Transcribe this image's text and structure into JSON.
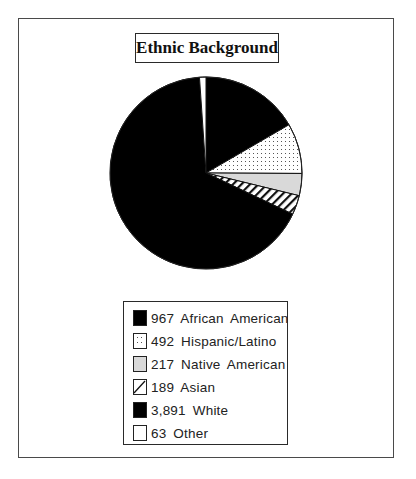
{
  "chart_data": {
    "type": "pie",
    "title": "Ethnic Background",
    "start_angle_deg": 0,
    "direction": "clockwise",
    "total": 5819,
    "slices": [
      {
        "label": "African American",
        "value": 967,
        "display": "967",
        "fill": "#000000",
        "pattern": "solid"
      },
      {
        "label": "Hispanic/Latino",
        "value": 492,
        "display": "492",
        "fill": "#ffffff",
        "pattern": "dots"
      },
      {
        "label": "Native American",
        "value": 217,
        "display": "217",
        "fill": "#d9d9d9",
        "pattern": "solid-gray"
      },
      {
        "label": "Asian",
        "value": 189,
        "display": "189",
        "fill": "#ffffff",
        "pattern": "diagonal-hatch"
      },
      {
        "label": "White",
        "value": 3891,
        "display": "3,891",
        "fill": "#000000",
        "pattern": "solid"
      },
      {
        "label": "Other",
        "value": 63,
        "display": "63",
        "fill": "#ffffff",
        "pattern": "solid-white"
      }
    ],
    "legend_position": "bottom"
  },
  "title": "Ethnic Background",
  "legend": {
    "items": [
      {
        "text": "967  African  American"
      },
      {
        "text": "492  Hispanic/Latino"
      },
      {
        "text": "217  Native  American"
      },
      {
        "text": "189  Asian"
      },
      {
        "text": "3,891  White"
      },
      {
        "text": "63  Other"
      }
    ]
  }
}
